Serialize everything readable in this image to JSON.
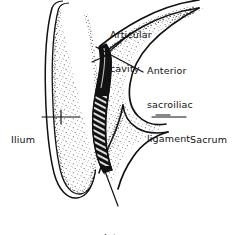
{
  "figure": {
    "kind": "anatomical-line-drawing",
    "width": 238,
    "height": 235,
    "background_color": "#ffffff",
    "ink_color": "#111111"
  },
  "labels": {
    "articular_cavity": {
      "line1": "Articular",
      "line2": "cavity"
    },
    "anterior_sacroiliac_ligament": {
      "line1": "Anterior",
      "line2": "sacroiliac",
      "line3": "ligament"
    },
    "ilium": {
      "line1": "Ilium"
    },
    "sacrum": {
      "line1": "Sacrum"
    },
    "interosseous_ligaments": {
      "line1": "Interosseous",
      "line2": "ligaments"
    }
  },
  "structures": [
    {
      "name": "ilium",
      "description": "elongated vertical iliac blade at left with double cortical outline and stippled cancellous interior",
      "fill": "#ffffff",
      "stipple": true
    },
    {
      "name": "sacrum",
      "description": "wedge-shaped sacral body at right with stippled interior and a notch inferiorly",
      "fill": "#ffffff",
      "stipple": true
    },
    {
      "name": "joint-space",
      "description": "dark sinuous band of cross-hatched fibres between ilium and sacrum representing the articular cavity and interosseous ligaments",
      "fill": "#111111",
      "hatched": true
    }
  ],
  "leaders": [
    {
      "name": "articular-cavity-leader"
    },
    {
      "name": "anterior-sacroiliac-ligament-leader"
    },
    {
      "name": "ilium-leader"
    },
    {
      "name": "sacrum-leader"
    },
    {
      "name": "interosseous-ligaments-leader"
    }
  ]
}
